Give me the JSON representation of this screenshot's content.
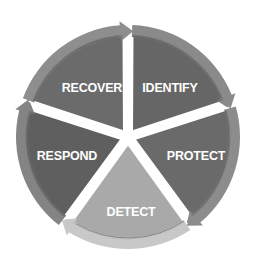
{
  "diagram": {
    "type": "cycle",
    "center": [
      128,
      137
    ],
    "radius": 112,
    "segments": [
      {
        "label": "IDENTIFY",
        "color": "#666666",
        "arrow_color": "#7d7d7d"
      },
      {
        "label": "PROTECT",
        "color": "#6a6a6a",
        "arrow_color": "#808080"
      },
      {
        "label": "DETECT",
        "color": "#a9a9a9",
        "arrow_color": "#c2c2c2"
      },
      {
        "label": "RESPOND",
        "color": "#5f5f5f",
        "arrow_color": "#777777"
      },
      {
        "label": "RECOVER",
        "color": "#6b6b6b",
        "arrow_color": "#828282"
      }
    ]
  }
}
